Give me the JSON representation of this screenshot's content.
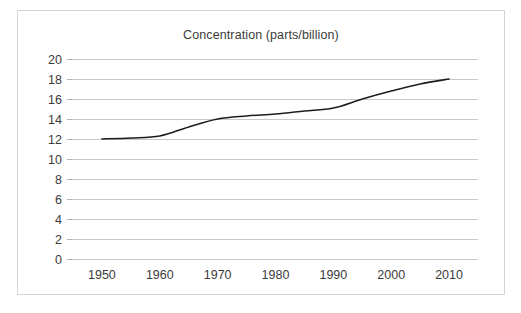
{
  "chart_data": {
    "type": "line",
    "title": "Concentration (parts/billion)",
    "xlabel": "",
    "ylabel": "",
    "xlim": [
      1945,
      2015
    ],
    "ylim": [
      0,
      20
    ],
    "grid": true,
    "legend": "none",
    "line_color": "#1d1d1d",
    "grid_color": "#c8c8c8",
    "text_color": "#3b3b3b",
    "x_tick_labels": [
      "1950",
      "1960",
      "1970",
      "1980",
      "1990",
      "2000",
      "2010"
    ],
    "x_ticks": [
      1950,
      1960,
      1970,
      1980,
      1990,
      2000,
      2010
    ],
    "y_tick_labels": [
      "20",
      "18",
      "16",
      "14",
      "12",
      "10",
      "8",
      "6",
      "4",
      "2",
      "0"
    ],
    "y_ticks": [
      20,
      18,
      16,
      14,
      12,
      10,
      8,
      6,
      4,
      2,
      0
    ],
    "series": [
      {
        "name": "Concentration",
        "x": [
          1950,
          1955,
          1960,
          1965,
          1970,
          1975,
          1980,
          1985,
          1990,
          1995,
          2000,
          2005,
          2010
        ],
        "values": [
          12.0,
          12.1,
          12.3,
          13.2,
          14.0,
          14.3,
          14.5,
          14.8,
          15.1,
          16.0,
          16.8,
          17.5,
          18.0
        ]
      }
    ]
  }
}
